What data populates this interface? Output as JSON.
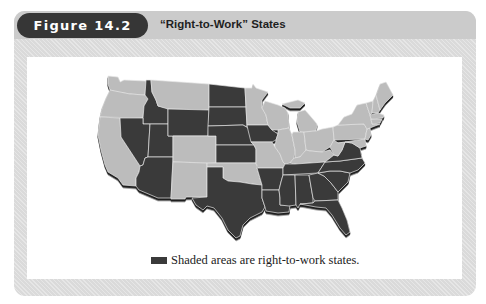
{
  "figure": {
    "label": "Figure 14.2",
    "title": "“Right-to-Work” States"
  },
  "legend": {
    "text": "Shaded areas are right-to-work states.",
    "swatch_color": "#3a3a3a"
  },
  "map": {
    "region": "Contiguous United States",
    "shaded_color": "#3a3a3a",
    "unshaded_color": "#bcbcbc",
    "states": {
      "WA": false,
      "OR": false,
      "CA": false,
      "ID": true,
      "NV": true,
      "UT": true,
      "AZ": true,
      "MT": false,
      "WY": true,
      "CO": false,
      "NM": false,
      "ND": true,
      "SD": true,
      "NE": true,
      "KS": true,
      "OK": false,
      "TX": true,
      "MN": false,
      "IA": true,
      "MO": false,
      "AR": true,
      "LA": true,
      "WI": false,
      "IL": false,
      "MI": false,
      "IN": false,
      "OH": false,
      "KY": false,
      "TN": true,
      "MS": true,
      "AL": true,
      "GA": true,
      "FL": true,
      "SC": true,
      "NC": true,
      "VA": true,
      "WV": false,
      "PA": false,
      "NY": false,
      "VT": false,
      "NH": false,
      "ME": false,
      "MA": false,
      "CT": false,
      "RI": false,
      "NJ": false,
      "DE": false,
      "MD": false
    }
  }
}
